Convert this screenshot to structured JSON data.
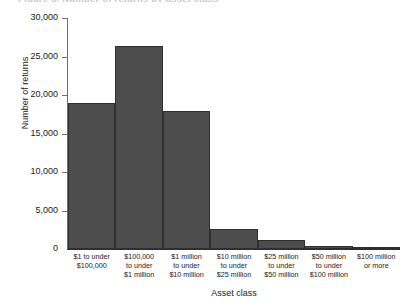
{
  "figure": {
    "title_remnant": "Figure 5. Number of returns by asset class",
    "background": "#ffffff",
    "bar_color": "#4d4d4d",
    "bar_edge_color": "#2f2f2f",
    "axis_color": "#6f6f6f"
  },
  "chart_data": {
    "type": "bar",
    "title": "",
    "xlabel": "Asset class",
    "ylabel": "Number of returns",
    "categories": [
      "$1 to under $100,000",
      "$100,000 to under $1 million",
      "$1 million to under $10 million",
      "$10 million to under $25 million",
      "$25 million to under $50 million",
      "$50 million to under $100 million",
      "$100 million or more"
    ],
    "category_lines": [
      [
        "$1 to under",
        "$100,000"
      ],
      [
        "$100,000",
        "to under",
        "$1 million"
      ],
      [
        "$1 million",
        "to under",
        "$10 million"
      ],
      [
        "$10 million",
        "to under",
        "$25 million"
      ],
      [
        "$25 million",
        "to under",
        "$50 million"
      ],
      [
        "$50 million",
        "to under",
        "$100 million"
      ],
      [
        "$100 million",
        "or more"
      ]
    ],
    "values": [
      19000,
      26400,
      17900,
      2600,
      1200,
      350,
      250
    ],
    "ylim": [
      0,
      30000
    ],
    "ytick_values": [
      0,
      5000,
      10000,
      15000,
      20000,
      25000,
      30000
    ],
    "ytick_labels": [
      "0",
      "5,000",
      "10,000",
      "15,000",
      "20,000",
      "25,000",
      "30,000"
    ],
    "grid": false,
    "legend": null,
    "histogram_style": true
  }
}
